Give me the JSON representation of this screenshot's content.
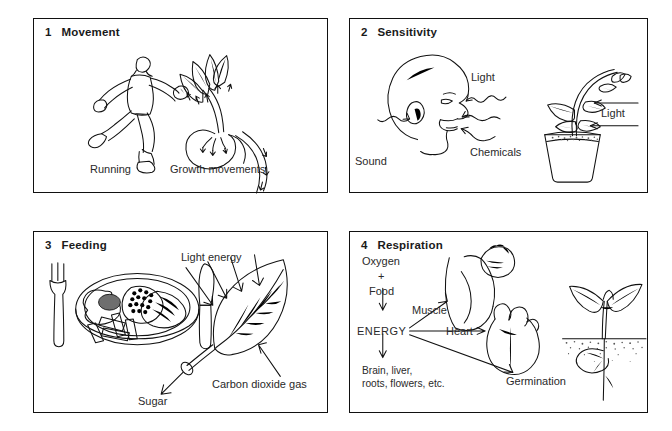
{
  "figure": {
    "panel_count": 4
  },
  "panels": [
    {
      "number": "1",
      "title": "Movement",
      "captions": {
        "human": "Running",
        "plant": "Growth movements"
      },
      "illustrations": [
        "running-man",
        "growing-seedling-with-direction-arrows"
      ]
    },
    {
      "number": "2",
      "title": "Sensitivity",
      "captions": {
        "light_head": "Light",
        "sound": "Sound",
        "chemicals": "Chemicals",
        "light_plant": "Light"
      },
      "illustrations": [
        "human-head-profile",
        "potted-plant-bending-to-light"
      ]
    },
    {
      "number": "3",
      "title": "Feeding",
      "captions": {
        "light_energy": "Light energy",
        "sugar": "Sugar",
        "carbon_dioxide": "Carbon dioxide gas"
      },
      "illustrations": [
        "plate-of-food-with-fork-and-knife",
        "leaf-with-light-arrows"
      ]
    },
    {
      "number": "4",
      "title": "Respiration",
      "captions": {
        "oxygen": "Oxygen",
        "plus": "+",
        "food": "Food",
        "energy": "ENERGY",
        "muscle": "Muscle",
        "heart": "Heart",
        "germination": "Germination",
        "outputs_line1": "Brain, liver,",
        "outputs_line2": "roots, flowers, etc."
      },
      "illustrations": [
        "flexed-arm",
        "human-heart",
        "germinating-seedling-in-soil"
      ]
    }
  ],
  "colors": {
    "ink": "#111111",
    "background": "#ffffff",
    "text": "#2a2a2a"
  }
}
